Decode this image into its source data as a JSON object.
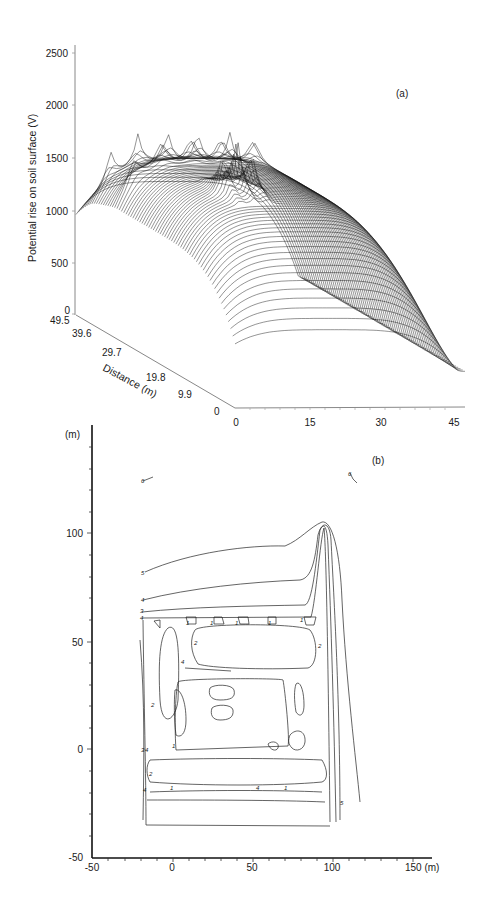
{
  "chart_data": [
    {
      "panel": "(a)",
      "type": "surface-3d-wireframe",
      "title": "",
      "zlabel": "Potential rise on soil surface (V)",
      "ylabel": "Distance (m)",
      "xlabel": "",
      "z_ticks": [
        "0",
        "500",
        "1000",
        "1500",
        "2000",
        "2500"
      ],
      "y_ticks": [
        "49.5",
        "39.6",
        "29.7",
        "19.8",
        "9.9",
        "0"
      ],
      "x_ticks": [
        "0",
        "15",
        "30",
        "45"
      ],
      "zlim": [
        0,
        2500
      ],
      "ylim": [
        0,
        49.5
      ],
      "xlim": [
        0,
        48
      ],
      "grid": false,
      "description": "Wireframe surface of soil-surface potential rise over a grounding grid; plateau around 1500-1800 V with sharp spikes (~1900 V) at grid conductor locations, falling to ~700 V at edges and ~300 V far from grid.",
      "approx_profile_along_x_at_mid_y": {
        "x": [
          0,
          5,
          10,
          15,
          20,
          25,
          30,
          35,
          40,
          45
        ],
        "z": [
          700,
          1500,
          1650,
          1700,
          1700,
          1650,
          1550,
          1100,
          650,
          400
        ]
      },
      "peak_values_approx": [
        1900,
        1850,
        1800
      ]
    },
    {
      "panel": "(b)",
      "type": "contour",
      "title": "",
      "xlabel": "(m)",
      "ylabel": "(m)",
      "x_ticks": [
        "-50",
        "0",
        "50",
        "100",
        "150 (m)"
      ],
      "y_ticks": [
        "-50",
        "0",
        "50",
        "100",
        "(m)"
      ],
      "xlim": [
        -50,
        150
      ],
      "ylim": [
        -50,
        150
      ],
      "contour_levels": [
        "1",
        "2",
        "3",
        "4",
        "5",
        "6"
      ],
      "grid": false,
      "description": "Equipotential contour map of a grounding grid area from about x=-20 to x=95 m, y=-20 to y=65 m, with a long protrusion near x=90 m reaching y≈105 m."
    }
  ],
  "panels": {
    "a": {
      "label": "(a)",
      "z_axis_title": "Potential rise on soil surface (V)",
      "y_axis_title": "Distance (m)",
      "z_ticks": [
        "0",
        "500",
        "1000",
        "1500",
        "2000",
        "2500"
      ],
      "y_ticks": [
        "49.5",
        "39.6",
        "29.7",
        "19.8",
        "9.9",
        "0"
      ],
      "x_ticks": [
        "0",
        "15",
        "30",
        "45"
      ]
    },
    "b": {
      "label": "(b)",
      "y_unit": "(m)",
      "y_ticks": [
        "100",
        "50",
        "0",
        "-50"
      ],
      "x_ticks": [
        "-50",
        "0",
        "50",
        "100",
        "150 (m)"
      ],
      "contour_labels": {
        "l6a": "6",
        "l6b": "6",
        "l5a": "5",
        "l5b": "5",
        "l4a": "4",
        "l3": "3",
        "l4b": "4",
        "l1a": "1",
        "l1b": "1",
        "l1c": "1",
        "l1d": "1",
        "l1e": "1",
        "l2a": "2",
        "l2b": "2",
        "l2c": "2",
        "l2d": "2",
        "l4c": "4",
        "l4d": "4",
        "l4e": "4",
        "l4f": "4",
        "l3b": "3",
        "l1f": "1",
        "l1g": "1",
        "l1h": "1"
      }
    }
  }
}
